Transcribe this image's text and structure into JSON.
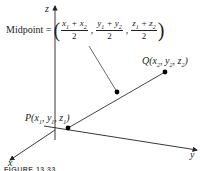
{
  "axes": {
    "x_label": "x",
    "y_label": "y",
    "z_label": "z"
  },
  "formula": {
    "word": "Midpoint =",
    "open_paren": "(",
    "close_paren": ")",
    "terms": [
      {
        "num_a": "x",
        "sub_a": "1",
        "num_b": "x",
        "sub_b": "2",
        "den": "2"
      },
      {
        "num_a": "y",
        "sub_a": "1",
        "num_b": "y",
        "sub_b": "2",
        "den": "2"
      },
      {
        "num_a": "z",
        "sub_a": "1",
        "num_b": "z",
        "sub_b": "2",
        "den": "2"
      }
    ]
  },
  "points": {
    "p_label": "P(x",
    "q_label": "Q(x"
  },
  "point_labels": {
    "P": {
      "name": "P",
      "coords": [
        "x",
        "1",
        "y",
        "1",
        "z",
        "1"
      ]
    },
    "Q": {
      "name": "Q",
      "coords": [
        "x",
        "2",
        "y",
        "2",
        "z",
        "2"
      ]
    }
  },
  "caption": "FIGURE 13.33"
}
